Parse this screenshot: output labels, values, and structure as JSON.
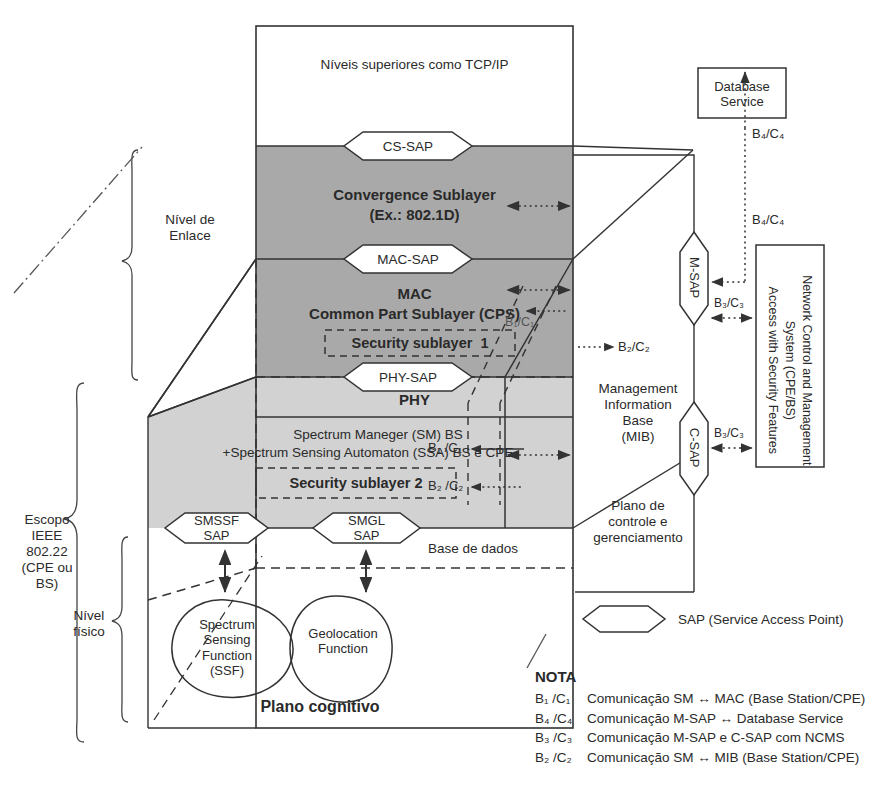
{
  "diagram": {
    "colors": {
      "dark_shade": "#a9a9a9",
      "light_shade": "#d2d2d2",
      "stroke": "#333333",
      "text": "#2a2a2a"
    }
  },
  "upper_layers": {
    "label": "Níveis superiores como TCP/IP"
  },
  "saps": {
    "cs": "CS-SAP",
    "mac": "MAC-SAP",
    "phy": "PHY-SAP",
    "smssf": "SMSSF\nSAP",
    "smgl": "SMGL\nSAP",
    "m_sap": "M-SAP",
    "c_sap": "C-SAP"
  },
  "layers": {
    "convergence_line1": "Convergence Sublayer",
    "convergence_line2": "(Ex.: 802.1D)",
    "mac_line1": "MAC",
    "mac_line2": "Common Part Sublayer (CPS)",
    "security_1": "Security sublayer  1",
    "phy": "PHY",
    "spectrum_line1": "Spectrum Maneger (SM) BS",
    "spectrum_line2": "+Spectrum Sensing Automaton (SSA) BS e CPE",
    "security_2": "Security sublayer 2",
    "base_de_dados": "Base de dados",
    "plano_cognitivo": "Plano cognitivo"
  },
  "functions": {
    "ssf": "Spectrum\nSensing\nFunction\n(SSF)",
    "geolocation": "Geolocation\nFunction"
  },
  "side_labels": {
    "nivel_enlace": "Nível de\nEnlace",
    "escopo": "Escopo\nIEEE\n802.22\n(CPE ou\nBS)",
    "nivel_fisico": "Nível\nfísico"
  },
  "management": {
    "mib": "Management\nInformation\nBase\n(MIB)",
    "plano_controle": "Plano de\ncontrole e\ngerenciamento"
  },
  "external": {
    "database_service": "Database\nService",
    "ncms": "Network Control and Management\nSystem (CPE/BS)\nAccess with Security Features"
  },
  "flow_labels": {
    "b1c1_inner": "B₁/C₁",
    "b2c2_right": "B₂/C₂",
    "b1c1_mid": "B₁ /C₁",
    "b2c2_mid": "B₂ /C₂",
    "b4c4_top": "B₄/C₄",
    "b4c4_msap": "B₄/C₄",
    "b3c3_msap": "B₃/C₃",
    "b3c3_csap": "B₃/C₃"
  },
  "legend": {
    "sap_legend": "SAP (Service Access Point)",
    "nota_title": "NOTA",
    "rows": [
      {
        "code": "B₁ /C₁",
        "text": "Comunicação SM ↔ MAC (Base Station/CPE)"
      },
      {
        "code": "B₄ /C₄",
        "text": "Comunicação M-SAP ↔ Database Service"
      },
      {
        "code": "B₃ /C₃",
        "text": "Comunicação M-SAP e C-SAP com NCMS"
      },
      {
        "code": "B₂ /C₂",
        "text": "Comunicação SM ↔ MIB (Base Station/CPE)"
      }
    ]
  }
}
